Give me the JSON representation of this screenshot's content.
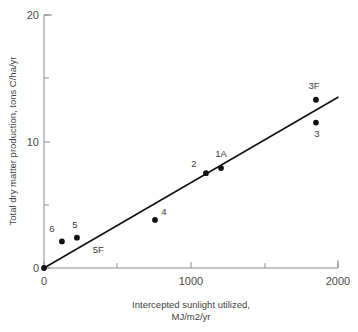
{
  "chart_data": {
    "type": "scatter",
    "title": "",
    "subtitle": "",
    "xlabel_line1": "Intercepted sunlight utilized,",
    "xlabel_line2": "MJ/m2/yr",
    "ylabel": "Total dry matter production, tons C/ha/yr",
    "xlim": [
      0,
      2000
    ],
    "ylim": [
      0,
      20
    ],
    "x_major_ticks": [
      0,
      1000,
      2000
    ],
    "x_major_tick_labels": [
      "0",
      "1000",
      "2000"
    ],
    "x_minor_ticks": [
      500,
      1500
    ],
    "y_major_ticks": [
      0,
      10,
      20
    ],
    "y_major_tick_labels": [
      "0",
      "10",
      "20"
    ],
    "y_minor_ticks": [
      5,
      15
    ],
    "grid": false,
    "legend": "none",
    "marker_color": "#111111",
    "line_color": "#111111",
    "axis_color": "#8c8c8c",
    "points": [
      {
        "label": "",
        "x": 0,
        "y": 0.0,
        "label_dx": 0,
        "label_dy": 0
      },
      {
        "label": "6",
        "x": 122,
        "y": 2.1,
        "label_dx": -10,
        "label_dy": -9
      },
      {
        "label": "5",
        "x": 224,
        "y": 2.4,
        "label_dx": -2,
        "label_dy": -10
      },
      {
        "label": "4",
        "x": 755,
        "y": 3.8,
        "label_dx": 9,
        "label_dy": -5
      },
      {
        "label": "2",
        "x": 1102,
        "y": 7.5,
        "label_dx": -12,
        "label_dy": -6
      },
      {
        "label": "1A",
        "x": 1204,
        "y": 7.9,
        "label_dx": 0,
        "label_dy": -11
      },
      {
        "label": "3F",
        "x": 1850,
        "y": 13.3,
        "label_dx": -2,
        "label_dy": -11
      },
      {
        "label": "3",
        "x": 1850,
        "y": 11.5,
        "label_dx": 1,
        "label_dy": 14
      }
    ],
    "extra_labels": [
      {
        "text": "5F",
        "x": 370,
        "y": 1.2
      }
    ],
    "fit_line": {
      "x1": 0,
      "y1": 0.0,
      "x2": 2000,
      "y2": 13.5,
      "description": "linear regression through origin"
    }
  }
}
